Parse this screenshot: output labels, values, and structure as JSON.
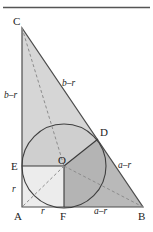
{
  "figure": {
    "title_rule": "horizontal-rule",
    "colors": {
      "stroke": "#4d4d4d",
      "dashed_stroke": "#8c8c8c",
      "circle_stroke": "#3f3f3f",
      "label_text": "#1d1d1d",
      "rule": "#555555",
      "fill_upper_triangle": "#d6d6d6",
      "fill_circle_upper_left": "#cfcfcf",
      "fill_square_aeof": "#eaeaea",
      "fill_sector_lower_right": "#b4b4b4",
      "fill_right_region": "#b9b9b9",
      "fill_background": "#ffffff"
    },
    "points": [
      {
        "id": "C",
        "label": "C",
        "x": 22,
        "y": 28
      },
      {
        "id": "A",
        "label": "A",
        "x": 22,
        "y": 207
      },
      {
        "id": "B",
        "label": "B",
        "x": 143,
        "y": 207
      },
      {
        "id": "O",
        "label": "O",
        "x": 64,
        "y": 166
      },
      {
        "id": "E",
        "label": "E",
        "x": 22,
        "y": 166
      },
      {
        "id": "F",
        "label": "F",
        "x": 64,
        "y": 207
      },
      {
        "id": "D",
        "label": "D",
        "x": 98,
        "y": 139
      }
    ],
    "circle": {
      "cx": 64,
      "cy": 166,
      "r": 42
    },
    "segment_labels": [
      {
        "id": "left-upper",
        "text": "b–r",
        "x": 9,
        "y": 95
      },
      {
        "id": "left-lower",
        "text": "r",
        "x": 11,
        "y": 190
      },
      {
        "id": "bottom-left",
        "text": "r",
        "x": 42,
        "y": 212
      },
      {
        "id": "bottom-right",
        "text": "a–r",
        "x": 98,
        "y": 212
      },
      {
        "id": "hyp-upper",
        "text": "b–r",
        "x": 67,
        "y": 84
      },
      {
        "id": "hyp-lower",
        "text": "a–r",
        "x": 122,
        "y": 166
      }
    ],
    "point_labels": [
      {
        "id": "C",
        "text": "C",
        "x": 13,
        "y": 25
      },
      {
        "id": "A",
        "text": "A",
        "x": 14,
        "y": 220
      },
      {
        "id": "B",
        "text": "B",
        "x": 140,
        "y": 220
      },
      {
        "id": "O",
        "text": "O",
        "x": 59,
        "y": 163
      },
      {
        "id": "E",
        "text": "E",
        "x": 12,
        "y": 170
      },
      {
        "id": "F",
        "text": "F",
        "x": 61,
        "y": 220
      },
      {
        "id": "D",
        "text": "D",
        "x": 101,
        "y": 136
      }
    ]
  }
}
